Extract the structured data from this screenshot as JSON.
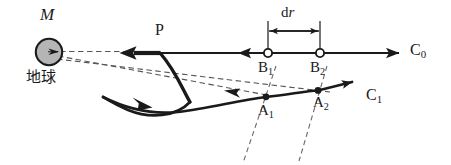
{
  "figure": {
    "title_alt": "Gravitational trajectory diagram with Earth mass M and orbits C0 and C1",
    "width": 451,
    "height": 165,
    "background": "#ffffff",
    "stroke_color": "#1a1a1a",
    "dashed_color": "#4d4d4d",
    "body_fill": "#b3b3b3"
  },
  "labels": {
    "mass": {
      "text": "M",
      "x": 40,
      "y": 8,
      "size": 17,
      "italic": true
    },
    "earth_cjk": {
      "text": "地球",
      "x": 26,
      "y": 70,
      "size": 16
    },
    "point_p": {
      "text": "P",
      "x": 155,
      "y": 24,
      "size": 16
    },
    "point_b1": {
      "text": "B",
      "sub": "1",
      "x": 258,
      "y": 62,
      "size": 15
    },
    "point_b2": {
      "text": "B",
      "sub": "2",
      "x": 310,
      "y": 62,
      "size": 15
    },
    "point_a1": {
      "text": "A",
      "sub": "1",
      "x": 258,
      "y": 104,
      "size": 15
    },
    "point_a2": {
      "text": "A",
      "sub": "2",
      "x": 313,
      "y": 96,
      "size": 15
    },
    "curve_c0": {
      "text": "C",
      "sub": "0",
      "x": 412,
      "y": 43,
      "size": 16
    },
    "curve_c1": {
      "text": "C",
      "sub": "1",
      "x": 368,
      "y": 89,
      "size": 16
    },
    "dr": {
      "text": "d",
      "italic_part": "r",
      "x": 282,
      "y": 8,
      "size": 15
    }
  },
  "geometry": {
    "earth": {
      "cx": 49,
      "cy": 52,
      "r": 13.5
    },
    "line_c0": {
      "x1": 120,
      "y1": 53,
      "x2": 400,
      "y2": 53
    },
    "p_point": {
      "x": 160,
      "y": 53
    },
    "b1": {
      "cx": 268,
      "cy": 53,
      "r": 4
    },
    "b2": {
      "cx": 320,
      "cy": 53,
      "r": 4
    },
    "a1": {
      "cx": 266,
      "cy": 97,
      "r": 3.4
    },
    "a2": {
      "cx": 318,
      "cy": 91,
      "r": 3.4
    },
    "dr_extent": {
      "left": 268,
      "right": 320,
      "tick_top": 22,
      "tick_bottom": 48,
      "arrow_y": 31
    }
  },
  "icons": {
    "earth_body": "filled-circle-icon",
    "open_marker": "open-circle-marker-icon",
    "filled_marker": "filled-dot-marker-icon",
    "arrowhead": "arrowhead-icon"
  }
}
